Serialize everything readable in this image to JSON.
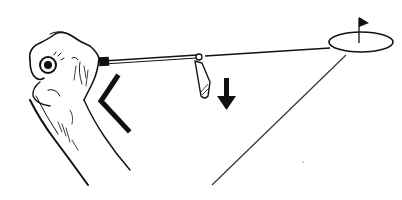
{
  "illustration": {
    "subject": "golf grip and target line instruction drawing",
    "colors": {
      "ink": "#111111",
      "background": "#ffffff",
      "faint": "#555555"
    },
    "elements": {
      "hands": "gripping-hands",
      "club_shaft": "shaft-line",
      "club_head": "iron-club-head",
      "angle_marker": "chevron-angle-marker",
      "down_arrow": "downward-arrow",
      "target": "hole-ellipse-with-flag",
      "target_line": "line-to-target",
      "ground_line": "diagonal-line"
    }
  }
}
